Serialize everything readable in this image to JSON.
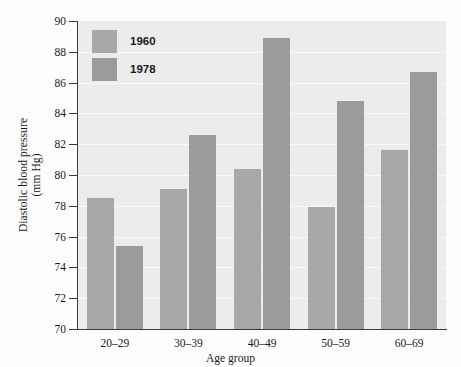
{
  "chart_data": {
    "type": "bar",
    "title": "",
    "xlabel": "Age group",
    "ylabel": "Diastolic blood pressure (mm Hg)",
    "ylabel_line1": "Diastolic blood pressure",
    "ylabel_line2": "(mm Hg)",
    "categories": [
      "20–29",
      "30–39",
      "40–49",
      "50–59",
      "60–69"
    ],
    "series": [
      {
        "name": "1960",
        "values": [
          78.5,
          79.1,
          80.4,
          77.9,
          81.6
        ],
        "color": "#a8a8a8"
      },
      {
        "name": "1978",
        "values": [
          75.4,
          82.6,
          88.9,
          84.8,
          86.7
        ],
        "color": "#9b9b9b"
      }
    ],
    "ylim": [
      70,
      90
    ],
    "yticks": [
      70,
      72,
      74,
      76,
      78,
      80,
      82,
      84,
      86,
      88,
      90
    ],
    "ytick_labels": [
      "70",
      "72",
      "74",
      "76",
      "78",
      "80",
      "82",
      "84",
      "86",
      "88",
      "90"
    ],
    "grid": true,
    "legend_position": "top-left",
    "plot_background": "#ececed"
  }
}
